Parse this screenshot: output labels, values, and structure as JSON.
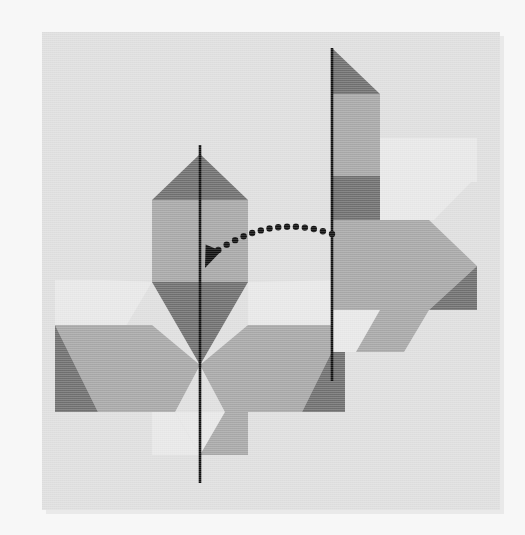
{
  "figure": {
    "type": "geometry-puzzle"
  },
  "canvas": {
    "width": 525,
    "height": 535,
    "page_background": "#f7f7f7",
    "card": {
      "x": 42,
      "y": 32,
      "width": 458,
      "height": 478,
      "background": "#dfdfdf",
      "shadow_color": "#e9e9e9",
      "shadow_offset_x": 4,
      "shadow_offset_y": 4
    }
  },
  "palette": {
    "dark_gray": "#707070",
    "medium_gray": "#a8a8a8",
    "light_gray": "#e8e8e8",
    "card_background": "#dfdfdf",
    "line_color": "#111111",
    "dot_color": "#111111"
  },
  "mirror_lines": [
    {
      "name": "left-mirror-line",
      "label": "Left axis of symmetry",
      "x": 200,
      "y_top": 145,
      "y_bottom": 483,
      "stroke_width": 2.6
    },
    {
      "name": "right-mirror-line",
      "label": "Right axis of symmetry",
      "x": 332,
      "y_top": 48,
      "y_bottom": 381,
      "stroke_width": 2.6
    }
  ],
  "arrow": {
    "name": "reflection-arrow",
    "label": "dotted reflection arrow",
    "dot_count": 15,
    "dot_radius": 3.2,
    "start": {
      "x": 332,
      "y": 234
    },
    "end": {
      "x": 210,
      "y": 256
    },
    "apex": {
      "x": 268,
      "y": 212
    },
    "head_tip": {
      "x": 205,
      "y": 268
    },
    "color": "#111111"
  },
  "left_figure": {
    "name": "left-figure",
    "label": "Full tri-rhombic pinwheel figure (left)",
    "center": {
      "x": 200,
      "y": 320
    },
    "unit": 96,
    "pieces": [
      {
        "name": "top-rhombus-upper-dark",
        "fill": "#707070",
        "role": "dark-cap"
      },
      {
        "name": "top-rhombus-body-medium",
        "fill": "#a8a8a8",
        "role": "medium-body"
      },
      {
        "name": "top-rhombus-lower-dark",
        "fill": "#707070",
        "role": "dark-tail"
      },
      {
        "name": "left-rhombus-light",
        "fill": "#e8e8e8",
        "role": "light-cap"
      },
      {
        "name": "left-rhombus-medium",
        "fill": "#a8a8a8",
        "role": "medium-body"
      },
      {
        "name": "left-rhombus-dark",
        "fill": "#707070",
        "role": "dark-tail"
      },
      {
        "name": "right-rhombus-light",
        "fill": "#e8e8e8",
        "role": "light-cap"
      },
      {
        "name": "right-rhombus-medium",
        "fill": "#a8a8a8",
        "role": "medium-body"
      },
      {
        "name": "right-rhombus-dark",
        "fill": "#707070",
        "role": "dark-tail"
      },
      {
        "name": "bottom-notch-light",
        "fill": "#e8e8e8",
        "role": "light-wedge"
      }
    ]
  },
  "right_figure": {
    "name": "right-figure",
    "label": "Half figure (right of the right mirror line)",
    "center": {
      "x": 332,
      "y": 200
    },
    "unit": 96,
    "clipped_side": "right",
    "pieces": [
      {
        "name": "half-top-dark",
        "fill": "#707070",
        "role": "dark-cap"
      },
      {
        "name": "half-top-medium",
        "fill": "#a8a8a8",
        "role": "medium-body"
      },
      {
        "name": "half-mid-light",
        "fill": "#e8e8e8",
        "role": "light-cap"
      },
      {
        "name": "half-mid-dark",
        "fill": "#707070",
        "role": "dark-tail"
      },
      {
        "name": "half-low-medium",
        "fill": "#a8a8a8",
        "role": "medium-body"
      },
      {
        "name": "half-low-dark",
        "fill": "#707070",
        "role": "dark-tail"
      },
      {
        "name": "half-bottom-light",
        "fill": "#e8e8e8",
        "role": "light-wedge"
      }
    ]
  }
}
